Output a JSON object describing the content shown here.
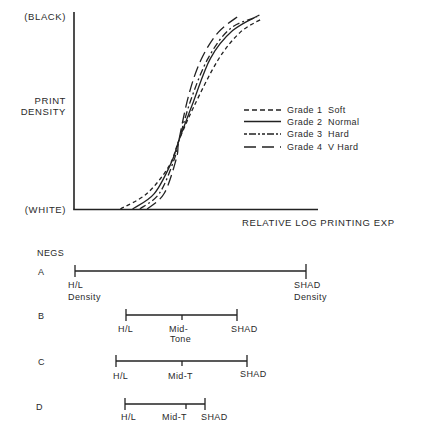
{
  "chart_data": {
    "type": "line",
    "title": "",
    "xlabel": "RELATIVE LOG PRINTING EXP",
    "ylabel": "PRINT DENSITY",
    "y_top_label": "(BLACK)",
    "y_bottom_label": "(WHITE)",
    "xlim": [
      0,
      1
    ],
    "ylim": [
      0,
      1
    ],
    "grid": false,
    "legend_position": "right-middle",
    "note": "Characteristic curves of paper grades; axes unlabeled numerically, values normalized 0-1",
    "series": [
      {
        "name": "Grade 1 Soft",
        "grade": "Grade 1",
        "desc": "Soft",
        "style": "short-dash",
        "points": [
          [
            0.19,
            0
          ],
          [
            0.3,
            0.08
          ],
          [
            0.39,
            0.22
          ],
          [
            0.43,
            0.35
          ],
          [
            0.49,
            0.52
          ],
          [
            0.59,
            0.76
          ],
          [
            0.68,
            0.9
          ],
          [
            0.77,
            0.97
          ]
        ]
      },
      {
        "name": "Grade 2 Normal",
        "grade": "Grade 2",
        "desc": "Normal",
        "style": "solid",
        "points": [
          [
            0.24,
            0
          ],
          [
            0.33,
            0.08
          ],
          [
            0.4,
            0.24
          ],
          [
            0.43,
            0.35
          ],
          [
            0.49,
            0.55
          ],
          [
            0.56,
            0.77
          ],
          [
            0.65,
            0.91
          ],
          [
            0.76,
            0.99
          ]
        ]
      },
      {
        "name": "Grade 3 Hard",
        "grade": "Grade 3",
        "desc": "Hard",
        "style": "dash-dot",
        "points": [
          [
            0.27,
            0
          ],
          [
            0.35,
            0.08
          ],
          [
            0.41,
            0.25
          ],
          [
            0.43,
            0.35
          ],
          [
            0.48,
            0.56
          ],
          [
            0.55,
            0.77
          ],
          [
            0.64,
            0.92
          ],
          [
            0.75,
            0.98
          ]
        ]
      },
      {
        "name": "Grade 4 V Hard",
        "grade": "Grade 4",
        "desc": "V Hard",
        "style": "long-dash",
        "points": [
          [
            0.3,
            0
          ],
          [
            0.37,
            0.08
          ],
          [
            0.42,
            0.26
          ],
          [
            0.43,
            0.35
          ],
          [
            0.47,
            0.58
          ],
          [
            0.52,
            0.76
          ],
          [
            0.59,
            0.9
          ],
          [
            0.68,
            0.99
          ]
        ]
      }
    ]
  },
  "chart": {
    "y_top": "(BLACK)",
    "y_label_1": "PRINT",
    "y_label_2": "DENSITY",
    "y_bottom": "(WHITE)",
    "x_label": "RELATIVE LOG PRINTING EXP",
    "legend": [
      {
        "grade": "Grade 1",
        "desc": "Soft"
      },
      {
        "grade": "Grade 2",
        "desc": "Normal"
      },
      {
        "grade": "Grade 3",
        "desc": "Hard"
      },
      {
        "grade": "Grade 4",
        "desc": "V Hard"
      }
    ]
  },
  "negs": {
    "title": "NEGS",
    "rows": [
      {
        "letter": "A",
        "hl": "H/L",
        "hl2": "Density",
        "mid": "",
        "mid2": "",
        "shad": "SHAD",
        "shad2": "Density",
        "start": 75,
        "end": 306,
        "mid_x": null
      },
      {
        "letter": "B",
        "hl": "H/L",
        "hl2": "",
        "mid": "Mid-",
        "mid2": "Tone",
        "shad": "SHAD",
        "shad2": "",
        "start": 126,
        "end": 237,
        "mid_x": 182
      },
      {
        "letter": "C",
        "hl": "H/L",
        "hl2": "",
        "mid": "Mid-T",
        "mid2": "",
        "shad": "SHAD",
        "shad2": "",
        "start": 116,
        "end": 247,
        "mid_x": 182
      },
      {
        "letter": "D",
        "hl": "H/L",
        "hl2": "",
        "mid": "Mid-T",
        "mid2": "",
        "shad": "SHAD",
        "shad2": "",
        "start": 125,
        "end": 205,
        "mid_x": 186
      }
    ]
  }
}
